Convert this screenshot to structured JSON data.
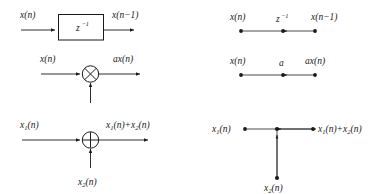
{
  "figure": {
    "title": "",
    "colors": {
      "line": "#1a1a1a",
      "text": "#1a1a1a",
      "background": "#ffffff"
    }
  },
  "blocks": {
    "delay": {
      "name": "unit-delay",
      "input_label": "x(n)",
      "output_label": "x(n−1)",
      "operator_base": "z",
      "operator_exponent": "−1",
      "block_shape": "rectangle"
    },
    "multiplier": {
      "name": "multiplier",
      "input_label": "x(n)",
      "output_label": "ax(n)",
      "gain_label": "a",
      "block_shape": "circle-with-cross"
    },
    "adder": {
      "name": "adder",
      "input_label_1": "x",
      "input_sub_1": "1",
      "input_tail_1": "(n)",
      "input_label_2": "x",
      "input_sub_2": "2",
      "input_tail_2": "(n)",
      "output_part_1": "x",
      "output_sub_1": "1",
      "output_mid": "(n)+x",
      "output_sub_2": "2",
      "output_tail": "(n)",
      "block_shape": "circle-with-plus"
    }
  },
  "flow_graph": {
    "delay": {
      "name": "unit-delay-flow",
      "source_label": "x(n)",
      "sink_label": "x(n−1)",
      "branch_base": "z",
      "branch_exponent": "−1",
      "node_count": 3
    },
    "multiplier": {
      "name": "multiplier-flow",
      "source_label": "x(n)",
      "sink_label": "ax(n)",
      "branch_label": "a",
      "node_count": 3
    },
    "adder": {
      "name": "adder-flow",
      "source_label_1": "x",
      "source_sub_1": "1",
      "source_tail_1": "(n)",
      "source_label_2": "x",
      "source_sub_2": "2",
      "source_tail_2": "(n)",
      "sink_part_1": "x",
      "sink_sub_1": "1",
      "sink_mid": "(n)+x",
      "sink_sub_2": "2",
      "sink_tail": "(n)",
      "node_count": 5
    }
  }
}
